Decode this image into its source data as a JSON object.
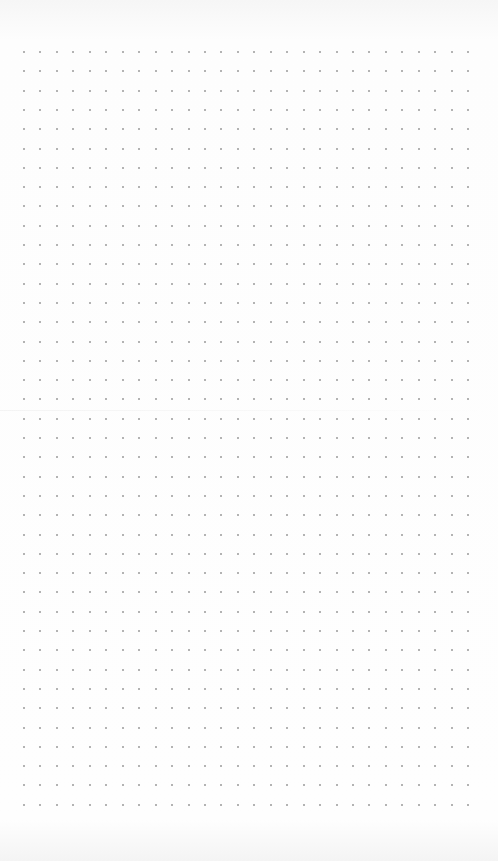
{
  "page": {
    "type": "dot-grid-paper",
    "background_color": "#fdfdfd",
    "dot_color": "#9a9a9a"
  },
  "grid": {
    "columns": 28,
    "rows": 40,
    "origin_x": 24,
    "origin_y": 52,
    "spacing_x": 16.45,
    "spacing_y": 19.3,
    "dot_size": 2
  }
}
